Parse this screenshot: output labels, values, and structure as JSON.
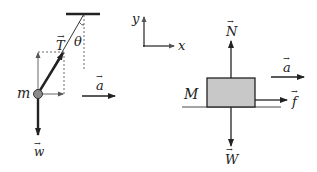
{
  "diagram": {
    "colors": {
      "ink": "#222222",
      "ball_fill": "#8a8a8a",
      "block_fill": "#c8c8c8",
      "background": "#ffffff"
    },
    "pendulum": {
      "mass_label": "m",
      "tension_label": "T",
      "angle_label": "θ",
      "weight_label": "w",
      "acceleration_label": "a"
    },
    "axes": {
      "x_label": "x",
      "y_label": "y"
    },
    "block": {
      "mass_label": "M",
      "normal_label": "N",
      "weight_label": "W",
      "friction_label": "f",
      "acceleration_label": "a"
    }
  }
}
